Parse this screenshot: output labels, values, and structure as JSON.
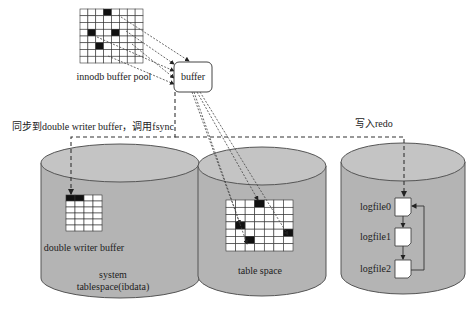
{
  "diagram": {
    "buffer_pool": {
      "label": "innodb buffer pool",
      "grid": {
        "cols": 8,
        "rows": 8,
        "dark_cells": [
          [
            3,
            0
          ],
          [
            1,
            3
          ],
          [
            4,
            3
          ],
          [
            2,
            5
          ]
        ]
      }
    },
    "buffer": {
      "label": "buffer"
    },
    "sync_label": "同步到double writer buffer，调用fsync",
    "redo_label": "写入redo",
    "cylinders": [
      {
        "id": "system-tablespace",
        "inner_label": "double writer buffer",
        "caption_line1": "system",
        "caption_line2": "tablespace(ibdata)",
        "grid": {
          "cols": 4,
          "rows": 6,
          "dark_cells": [
            [
              0,
              0
            ],
            [
              1,
              0
            ]
          ]
        }
      },
      {
        "id": "table-space",
        "caption": "table space",
        "grid": {
          "cols": 7,
          "rows": 7,
          "dark_cells": [
            [
              3,
              0
            ],
            [
              1,
              3
            ],
            [
              6,
              4
            ],
            [
              2,
              5
            ]
          ]
        }
      },
      {
        "id": "redo-log",
        "logfiles": [
          "logfile0",
          "logfile1",
          "logfile2"
        ]
      }
    ],
    "colors": {
      "cylinder_fill": "#b4b4b4",
      "cylinder_top": "#c4c4c4",
      "dark_cell": "#111111"
    }
  }
}
